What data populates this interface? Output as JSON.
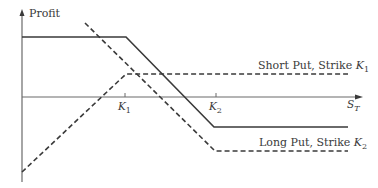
{
  "diagram": {
    "type": "option-payoff-diagram",
    "y_axis_label": "Profit",
    "x_axis_label": {
      "base": "S",
      "sub": "T"
    },
    "ticks": [
      {
        "base": "K",
        "sub": "1"
      },
      {
        "base": "K",
        "sub": "2"
      }
    ],
    "series": [
      {
        "name": "Short Put, Strike K1",
        "label_text": "Short Put, Strike ",
        "label_k_base": "K",
        "label_k_sub": "1",
        "style": "dashed"
      },
      {
        "name": "Long Put, Strike K2",
        "label_text": "Long Put, Strike ",
        "label_k_base": "K",
        "label_k_sub": "2",
        "style": "dashed"
      },
      {
        "name": "Combined (Bear Spread)",
        "style": "solid"
      }
    ],
    "colors": {
      "line": "#3a3a3a",
      "axis": "#6a6a6a"
    }
  }
}
